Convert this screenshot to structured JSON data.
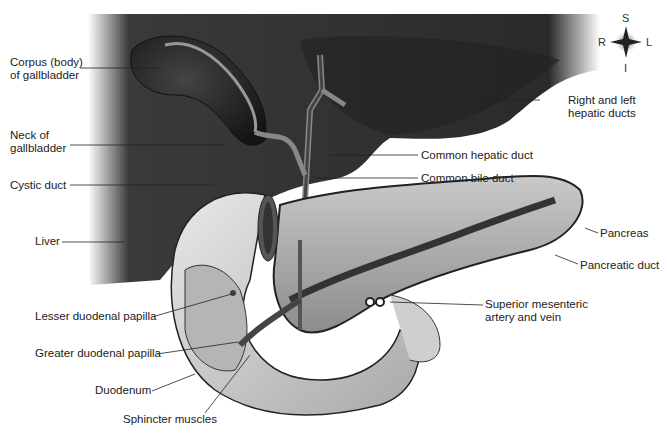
{
  "figure": {
    "colors": {
      "liver": "#2e2e2e",
      "liver_shadow": "#1a1a1a",
      "organ_light": "#d9d9d9",
      "duodenum": "#c8c8c8",
      "pancreas": "#a8a8a8",
      "duct": "#555555",
      "background": "#ffffff"
    }
  },
  "compass": {
    "superior": "S",
    "inferior": "I",
    "right": "R",
    "left": "L"
  },
  "labels": {
    "corpus": "Corpus (body)\nof gallbladder",
    "neck": "Neck of\ngallbladder",
    "cystic": "Cystic duct",
    "liver": "Liver",
    "lesser_papilla": "Lesser duodenal papilla",
    "greater_papilla": "Greater duodenal papilla",
    "duodenum": "Duodenum",
    "sphincter": "Sphincter muscles",
    "hepatic_ducts": "Right and left\nhepatic ducts",
    "common_hepatic": "Common hepatic duct",
    "common_bile": "Common bile duct",
    "pancreas": "Pancreas",
    "pancreatic_duct": "Pancreatic duct",
    "sma": "Superior mesenteric\nartery and vein"
  }
}
